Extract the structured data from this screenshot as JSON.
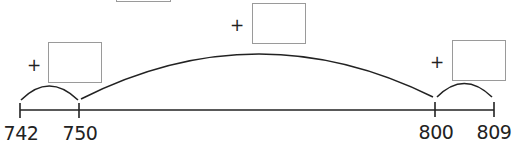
{
  "number_line": {
    "points": [
      {
        "label": "742",
        "x": 20
      },
      {
        "label": "750",
        "x": 79
      },
      {
        "label": "800",
        "x": 435
      },
      {
        "label": "809",
        "x": 494
      }
    ]
  },
  "jumps": [
    {
      "from": "742",
      "to": "750",
      "operator": "+",
      "answer": ""
    },
    {
      "from": "750",
      "to": "800",
      "operator": "+",
      "answer": ""
    },
    {
      "from": "800",
      "to": "809",
      "operator": "+",
      "answer": ""
    }
  ],
  "colors": {
    "line": "#222222",
    "box_border": "#9a9a9a"
  }
}
